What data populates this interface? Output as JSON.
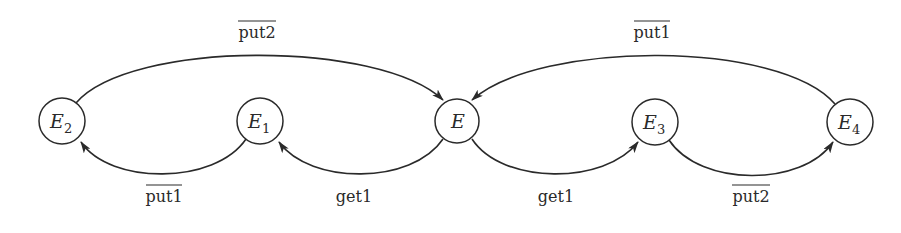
{
  "diagram": {
    "type": "state-transition",
    "colors": {
      "stroke": "#2a2a2a",
      "background": "#ffffff"
    },
    "nodes": [
      {
        "id": "E2",
        "label": "E",
        "subscript": "2",
        "x": 62,
        "y": 121
      },
      {
        "id": "E1",
        "label": "E",
        "subscript": "1",
        "x": 260,
        "y": 121
      },
      {
        "id": "E",
        "label": "E",
        "subscript": "",
        "x": 457,
        "y": 121
      },
      {
        "id": "E3",
        "label": "E",
        "subscript": "3",
        "x": 655,
        "y": 122
      },
      {
        "id": "E4",
        "label": "E",
        "subscript": "4",
        "x": 850,
        "y": 122
      }
    ],
    "edges": [
      {
        "from": "E2",
        "to": "E",
        "label": "put2",
        "overline": true,
        "position": "top"
      },
      {
        "from": "E4",
        "to": "E",
        "label": "put1",
        "overline": true,
        "position": "top"
      },
      {
        "from": "E1",
        "to": "E2",
        "label": "put1",
        "overline": true,
        "position": "bottom"
      },
      {
        "from": "E",
        "to": "E1",
        "label": "get1",
        "overline": false,
        "position": "bottom"
      },
      {
        "from": "E",
        "to": "E3",
        "label": "get1",
        "overline": false,
        "position": "bottom"
      },
      {
        "from": "E3",
        "to": "E4",
        "label": "put2",
        "overline": true,
        "position": "bottom"
      }
    ]
  }
}
